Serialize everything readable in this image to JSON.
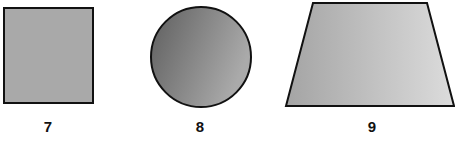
{
  "figures": [
    {
      "label": "7",
      "shape": "square",
      "fill": "#a9a9a9"
    },
    {
      "label": "8",
      "shape": "circle",
      "fill_dark": "#6a6a6a",
      "fill_light": "#a8a8a8"
    },
    {
      "label": "9",
      "shape": "trapezoid",
      "fill_dark": "#a6a6a6",
      "fill_light": "#d8d8d8"
    }
  ],
  "stroke_color": "#111111"
}
